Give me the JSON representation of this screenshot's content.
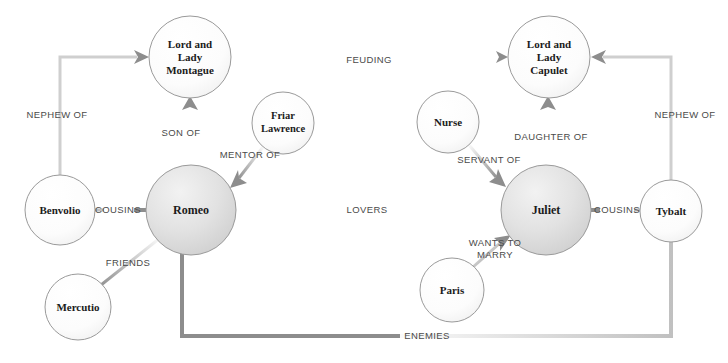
{
  "diagram": {
    "type": "node-link-graph",
    "width": 728,
    "height": 363,
    "background_color": "#ffffff",
    "node_stroke_color": "#9a9a9a",
    "edge_color": "#8d8d8d",
    "node_label_color": "#1b1b1b",
    "edge_label_color": "#4a4a4a",
    "nodes": [
      {
        "id": "montague",
        "label": "Lord and Lady Montague",
        "lines": [
          "Lord and",
          "Lady",
          "Montague"
        ],
        "cx": 190,
        "cy": 57,
        "r": 41,
        "emphasis": "light"
      },
      {
        "id": "capulet",
        "label": "Lord and Lady Capulet",
        "lines": [
          "Lord and",
          "Lady",
          "Capulet"
        ],
        "cx": 549,
        "cy": 57,
        "r": 41,
        "emphasis": "light"
      },
      {
        "id": "romeo",
        "label": "Romeo",
        "lines": [
          "Romeo"
        ],
        "cx": 191,
        "cy": 210,
        "r": 45,
        "emphasis": "strong"
      },
      {
        "id": "juliet",
        "label": "Juliet",
        "lines": [
          "Juliet"
        ],
        "cx": 546,
        "cy": 210,
        "r": 45,
        "emphasis": "strong"
      },
      {
        "id": "friar-lawrence",
        "label": "Friar Lawrence",
        "lines": [
          "Friar",
          "Lawrence"
        ],
        "cx": 283,
        "cy": 123,
        "r": 31,
        "emphasis": "light"
      },
      {
        "id": "nurse",
        "label": "Nurse",
        "lines": [
          "Nurse"
        ],
        "cx": 448,
        "cy": 122,
        "r": 31,
        "emphasis": "light"
      },
      {
        "id": "benvolio",
        "label": "Benvolio",
        "lines": [
          "Benvolio"
        ],
        "cx": 60,
        "cy": 210,
        "r": 35,
        "emphasis": "light"
      },
      {
        "id": "tybalt",
        "label": "Tybalt",
        "lines": [
          "Tybalt"
        ],
        "cx": 671,
        "cy": 211,
        "r": 31,
        "emphasis": "light"
      },
      {
        "id": "mercutio",
        "label": "Mercutio",
        "lines": [
          "Mercutio"
        ],
        "cx": 78,
        "cy": 307,
        "r": 33,
        "emphasis": "light"
      },
      {
        "id": "paris",
        "label": "Paris",
        "lines": [
          "Paris"
        ],
        "cx": 452,
        "cy": 290,
        "r": 32,
        "emphasis": "light"
      }
    ],
    "edges": [
      {
        "id": "feuding",
        "label": "FEUDING",
        "source": "montague",
        "target": "capulet",
        "label_x": 369,
        "label_y": 60,
        "directed": false
      },
      {
        "id": "son-of",
        "label": "SON OF",
        "source": "romeo",
        "target": "montague",
        "label_x": 181,
        "label_y": 133,
        "directed": true
      },
      {
        "id": "daughter-of",
        "label": "DAUGHTER OF",
        "source": "juliet",
        "target": "capulet",
        "label_x": 551,
        "label_y": 137,
        "directed": true
      },
      {
        "id": "mentor-of",
        "label": "MENTOR OF",
        "source": "friar-lawrence",
        "target": "romeo",
        "label_x": 250,
        "label_y": 155,
        "directed": true
      },
      {
        "id": "servant-of",
        "label": "SERVANT OF",
        "source": "nurse",
        "target": "juliet",
        "label_x": 489,
        "label_y": 160,
        "directed": true
      },
      {
        "id": "nephew-of-left",
        "label": "NEPHEW OF",
        "source": "benvolio",
        "target": "montague",
        "label_x": 57,
        "label_y": 115,
        "directed": true
      },
      {
        "id": "nephew-of-right",
        "label": "NEPHEW OF",
        "source": "tybalt",
        "target": "capulet",
        "label_x": 685,
        "label_y": 115,
        "directed": true
      },
      {
        "id": "cousins-left",
        "label": "COUSINS",
        "source": "benvolio",
        "target": "romeo",
        "label_x": 118,
        "label_y": 210,
        "directed": false
      },
      {
        "id": "cousins-right",
        "label": "COUSINS",
        "source": "juliet",
        "target": "tybalt",
        "label_x": 617,
        "label_y": 210,
        "directed": false
      },
      {
        "id": "lovers",
        "label": "LOVERS",
        "source": "romeo",
        "target": "juliet",
        "label_x": 367,
        "label_y": 210,
        "directed": false
      },
      {
        "id": "friends",
        "label": "FRIENDS",
        "source": "mercutio",
        "target": "romeo",
        "label_x": 128,
        "label_y": 263,
        "directed": false
      },
      {
        "id": "wants-to-marry",
        "label": "WANTS TO MARRY",
        "lines": [
          "WANTS TO",
          "MARRY"
        ],
        "source": "paris",
        "target": "juliet",
        "label_x": 495,
        "label_y": 249,
        "directed": true
      },
      {
        "id": "enemies",
        "label": "ENEMIES",
        "source": "romeo",
        "target": "tybalt",
        "label_x": 427,
        "label_y": 336,
        "directed": false
      }
    ]
  }
}
